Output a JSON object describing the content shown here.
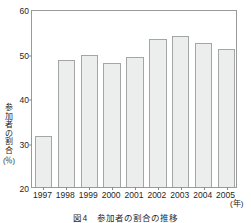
{
  "chart_data": {
    "type": "bar",
    "title": "",
    "caption_number": "図4",
    "caption_text": "参加者の割合の推移",
    "xlabel": "",
    "x_unit": "(年)",
    "ylabel": "参加者の割合",
    "y_unit": "(％)",
    "categories": [
      "1997",
      "1998",
      "1999",
      "2000",
      "2001",
      "2002",
      "2003",
      "2004",
      "2005"
    ],
    "values": [
      31.5,
      48.5,
      49.7,
      47.8,
      49.2,
      53.2,
      53.9,
      52.4,
      51.1
    ],
    "ylim": [
      20,
      60
    ],
    "yticks": [
      20,
      30,
      40,
      50,
      60
    ],
    "ytick_labels": [
      "20",
      "30",
      "40",
      "50",
      "60"
    ],
    "grid": false,
    "legend": "none",
    "bar_fill_color": "#eceded",
    "bar_border_color": "#a3a5a6",
    "axis_color": "#9a9a9a"
  },
  "ylabel_chars": [
    "参",
    "加",
    "者",
    "の",
    "割",
    "合"
  ]
}
